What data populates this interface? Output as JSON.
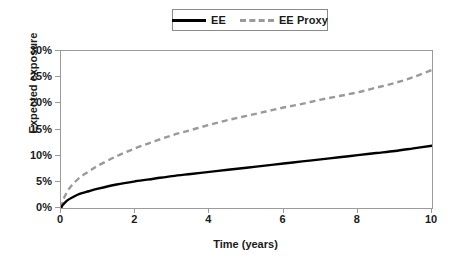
{
  "chart_data": {
    "type": "line",
    "title": "",
    "xlabel": "Time (years)",
    "ylabel": "Expected exposure",
    "xlim": [
      0,
      10
    ],
    "ylim": [
      0,
      30
    ],
    "grid": false,
    "legend_position": "top-center",
    "x_ticks": [
      "0",
      "2",
      "4",
      "6",
      "8",
      "10"
    ],
    "x_tick_values": [
      0,
      2,
      4,
      6,
      8,
      10
    ],
    "y_ticks": [
      "0%",
      "5%",
      "10%",
      "15%",
      "20%",
      "25%",
      "30%"
    ],
    "y_tick_values": [
      0,
      5,
      10,
      15,
      20,
      25,
      30
    ],
    "y_unit": "percent",
    "x": [
      0,
      0.05,
      0.1,
      0.2,
      0.3,
      0.5,
      0.75,
      1,
      1.5,
      2,
      2.5,
      3,
      3.5,
      4,
      4.5,
      5,
      5.5,
      6,
      6.5,
      7,
      7.5,
      8,
      8.5,
      9,
      9.5,
      10
    ],
    "series": [
      {
        "name": "EE",
        "color": "#000000",
        "style": "solid",
        "values": [
          0,
          0.6,
          1.0,
          1.6,
          2.0,
          2.7,
          3.2,
          3.7,
          4.5,
          5.1,
          5.6,
          6.1,
          6.5,
          6.9,
          7.3,
          7.7,
          8.1,
          8.5,
          8.9,
          9.3,
          9.7,
          10.1,
          10.5,
          10.9,
          11.4,
          11.9
        ]
      },
      {
        "name": "EE Proxy",
        "color": "#9a9a9a",
        "style": "dashed",
        "values": [
          0,
          1.3,
          2.2,
          3.5,
          4.4,
          5.8,
          7.0,
          8.1,
          9.9,
          11.4,
          12.7,
          13.9,
          14.9,
          15.9,
          16.8,
          17.6,
          18.4,
          19.2,
          19.9,
          20.7,
          21.4,
          22.1,
          23.0,
          23.9,
          25.0,
          26.4
        ]
      }
    ]
  },
  "legend": {
    "entries": [
      {
        "label": "EE"
      },
      {
        "label": "EE Proxy"
      }
    ]
  },
  "colors": {
    "ee_line": "#000000",
    "ee_proxy_line": "#9a9a9a",
    "axis": "#9b9b9b",
    "text": "#1a1a1a",
    "background": "#ffffff"
  }
}
